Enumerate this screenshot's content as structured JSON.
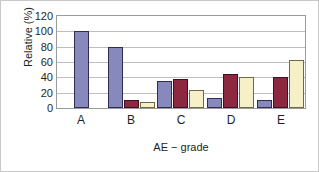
{
  "chart_data": {
    "type": "bar",
    "title": "",
    "subtitle": "",
    "xlabel": "AE − grade",
    "ylabel": "Relative (%)",
    "categories": [
      "A",
      "B",
      "C",
      "D",
      "E"
    ],
    "series": [
      {
        "name": "series-1",
        "color": "#8789bd",
        "values": [
          100,
          80,
          35,
          13,
          11
        ]
      },
      {
        "name": "series-2",
        "color": "#8c2840",
        "values": [
          0,
          11,
          38,
          45,
          40
        ]
      },
      {
        "name": "series-3",
        "color": "#f5f0c8",
        "values": [
          0,
          8,
          24,
          40,
          62
        ]
      }
    ],
    "ylim": [
      0,
      120
    ],
    "ytick_labels": [
      "120",
      "100",
      "80",
      "60",
      "40",
      "20",
      "0"
    ],
    "ytick_values": [
      120,
      100,
      80,
      60,
      40,
      20,
      0
    ],
    "grid": true,
    "grid_axis": "y",
    "legend": false,
    "legend_position": "none",
    "annotations": []
  },
  "figure": {
    "plot_border_color": "#9a9a9a",
    "grid_color": "#bdbdbd",
    "outer_border_color": "#c8c8c8",
    "background": "#ffffff",
    "text_color": "#231f20"
  }
}
